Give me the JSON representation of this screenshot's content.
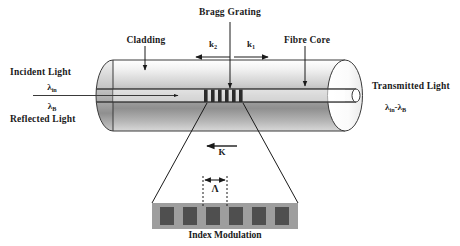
{
  "figure": {
    "background_color": "#ffffff",
    "ink_color": "#1a1a1a",
    "cladding_fill_light": "#f2f2f2",
    "cladding_fill_dark": "#8a8a8a",
    "grating_stripe_color": "#2b2b2b",
    "modulation_block_color": "#9e9e9e",
    "modulation_bar_color": "#4a4a4a"
  },
  "labels": {
    "bragg_grating": "Bragg Grating",
    "cladding": "Cladding",
    "fibre_core": "Fibre Core",
    "incident_light": "Incident Light",
    "incident_wavelength": "λ",
    "incident_wavelength_sub": "in",
    "reflected_wavelength": "λ",
    "reflected_wavelength_sub": "B",
    "reflected_light": "Reflected Light",
    "transmitted_light": "Transmitted Light",
    "transmitted_wavelength_a": "λ",
    "transmitted_wavelength_a_sub": "in",
    "transmitted_wavelength_minus": "-λ",
    "transmitted_wavelength_b_sub": "B",
    "k2": "k",
    "k2_sub": "2",
    "k1": "k",
    "k1_sub": "1",
    "k_vector": "K",
    "period": "Λ",
    "index_modulation": "Index Modulation"
  },
  "geometry": {
    "grating_stripe_count": 6,
    "modulation_bar_count": 6,
    "k2_direction": "left",
    "k1_direction": "right",
    "k_vector_direction": "left",
    "incident_arrow_direction": "right"
  }
}
